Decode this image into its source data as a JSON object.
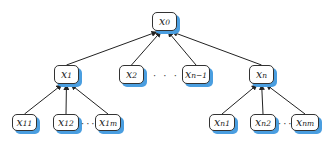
{
  "diagram": {
    "type": "tree",
    "shadow_color": "#4a9ee0",
    "nodes": [
      {
        "id": "x0",
        "base": "x",
        "sub": "0",
        "x": 152,
        "y": 12,
        "w": 25,
        "h": 19
      },
      {
        "id": "x1",
        "base": "x",
        "sub": "1",
        "x": 54,
        "y": 65,
        "w": 25,
        "h": 19
      },
      {
        "id": "x2",
        "base": "x",
        "sub": "2",
        "x": 119,
        "y": 65,
        "w": 25,
        "h": 19
      },
      {
        "id": "xn-1",
        "base": "x",
        "sub": "n−1",
        "x": 182,
        "y": 65,
        "w": 28,
        "h": 19
      },
      {
        "id": "xn",
        "base": "x",
        "sub": "n",
        "x": 249,
        "y": 65,
        "w": 25,
        "h": 19
      },
      {
        "id": "x11",
        "base": "x",
        "sub": "11",
        "x": 12,
        "y": 114,
        "w": 25,
        "h": 17
      },
      {
        "id": "x12",
        "base": "x",
        "sub": "12",
        "x": 53,
        "y": 114,
        "w": 26,
        "h": 17
      },
      {
        "id": "x1m",
        "base": "x",
        "sub": "1m",
        "x": 95,
        "y": 114,
        "w": 26,
        "h": 17
      },
      {
        "id": "xn1",
        "base": "x",
        "sub": "n1",
        "x": 209,
        "y": 114,
        "w": 26,
        "h": 17
      },
      {
        "id": "xn2",
        "base": "x",
        "sub": "n2",
        "x": 250,
        "y": 114,
        "w": 26,
        "h": 17
      },
      {
        "id": "xnm",
        "base": "x",
        "sub": "nm",
        "x": 291,
        "y": 114,
        "w": 28,
        "h": 17
      }
    ],
    "edges": [
      {
        "from": "x1",
        "to": "x0"
      },
      {
        "from": "x2",
        "to": "x0"
      },
      {
        "from": "xn-1",
        "to": "x0"
      },
      {
        "from": "xn",
        "to": "x0"
      },
      {
        "from": "x11",
        "to": "x1"
      },
      {
        "from": "x12",
        "to": "x1"
      },
      {
        "from": "x1m",
        "to": "x1"
      },
      {
        "from": "xn1",
        "to": "xn"
      },
      {
        "from": "xn2",
        "to": "xn"
      },
      {
        "from": "xnm",
        "to": "xn"
      }
    ],
    "ellipses": [
      {
        "text": "· · ·",
        "x": 153,
        "y": 70
      },
      {
        "text": "···",
        "x": 81,
        "y": 118
      },
      {
        "text": "···",
        "x": 278,
        "y": 118
      }
    ]
  }
}
